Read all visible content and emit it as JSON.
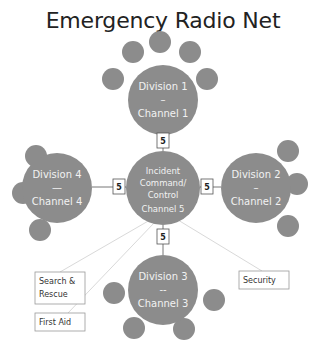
{
  "title": "Emergency Radio Net",
  "colors": {
    "node_fill": "#8c8c8c",
    "node_text": "#f2f2f2",
    "link_box_border": "#555555",
    "connector_line": "#d9d9d9"
  },
  "center": {
    "lines": [
      "Incident",
      "Command/",
      "Control",
      "Channel 5"
    ]
  },
  "divisions": [
    {
      "id": "division-1",
      "lines": [
        "Division 1",
        "–",
        "Channel 1"
      ]
    },
    {
      "id": "division-2",
      "lines": [
        "Division 2",
        "–",
        "Channel 2"
      ]
    },
    {
      "id": "division-3",
      "lines": [
        "Division 3",
        "--",
        "Channel 3"
      ]
    },
    {
      "id": "division-4",
      "lines": [
        "Division 4",
        "—",
        "Channel 4"
      ]
    }
  ],
  "links": [
    {
      "to": "division-1",
      "label": "5"
    },
    {
      "to": "division-2",
      "label": "5"
    },
    {
      "to": "division-3",
      "label": "5"
    },
    {
      "to": "division-4",
      "label": "5"
    }
  ],
  "units": [
    {
      "lines": [
        "Search &",
        "Rescue"
      ]
    },
    {
      "lines": [
        "First Aid"
      ]
    },
    {
      "lines": [
        "Security"
      ]
    }
  ]
}
